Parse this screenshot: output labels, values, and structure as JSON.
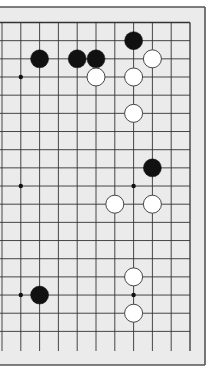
{
  "diagram": {
    "type": "go-board-partial",
    "visible_columns": [
      9,
      10,
      11,
      12,
      13,
      14,
      15,
      16,
      17,
      18,
      19
    ],
    "visible_rows": [
      1,
      2,
      3,
      4,
      5,
      6,
      7,
      8,
      9,
      10,
      11,
      12,
      13,
      14,
      15,
      16,
      17,
      18
    ],
    "edges": {
      "top": true,
      "right": true,
      "left": false,
      "bottom": false
    },
    "colors": {
      "page_background": "#ffffff",
      "board_fill": "#ebebeb",
      "frame": "#555555",
      "grid_line": "#333333",
      "black_stone": "#111111",
      "white_stone": "#ffffff",
      "white_stone_outline": "#333333"
    },
    "star_points": [
      {
        "col": 10,
        "row": 4
      },
      {
        "col": 10,
        "row": 10
      },
      {
        "col": 16,
        "row": 10
      },
      {
        "col": 10,
        "row": 16
      },
      {
        "col": 16,
        "row": 16
      }
    ],
    "stones": [
      {
        "color": "black",
        "col": 16,
        "row": 2
      },
      {
        "color": "black",
        "col": 11,
        "row": 3
      },
      {
        "color": "black",
        "col": 13,
        "row": 3
      },
      {
        "color": "black",
        "col": 14,
        "row": 3
      },
      {
        "color": "white",
        "col": 17,
        "row": 3
      },
      {
        "color": "white",
        "col": 14,
        "row": 4
      },
      {
        "color": "white",
        "col": 16,
        "row": 4
      },
      {
        "color": "white",
        "col": 16,
        "row": 6
      },
      {
        "color": "black",
        "col": 17,
        "row": 9
      },
      {
        "color": "white",
        "col": 15,
        "row": 11
      },
      {
        "color": "white",
        "col": 17,
        "row": 11
      },
      {
        "color": "white",
        "col": 16,
        "row": 15
      },
      {
        "color": "black",
        "col": 11,
        "row": 16
      },
      {
        "color": "white",
        "col": 16,
        "row": 17
      }
    ]
  }
}
